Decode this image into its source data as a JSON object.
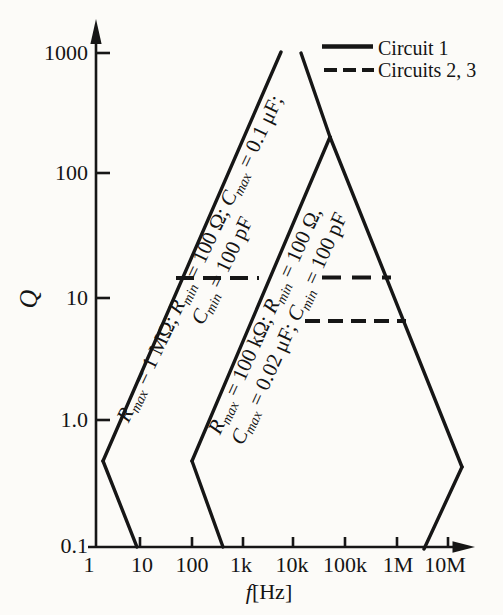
{
  "colors": {
    "ink": "#161616",
    "background": "#fcfbf8"
  },
  "axes": {
    "y_label": "Q",
    "x_label_rich": [
      {
        "t": "f",
        "i": 1
      },
      {
        "t": "[Hz]"
      }
    ],
    "y_ticks": [
      "1000",
      "100",
      "10",
      "1.0",
      "0.1"
    ],
    "x_ticks": [
      "1",
      "10",
      "100",
      "1k",
      "10k",
      "100k",
      "1M",
      "10M"
    ]
  },
  "legend": {
    "items": [
      {
        "label": "Circuit 1",
        "style": "solid"
      },
      {
        "label": "Circuits 2, 3",
        "style": "dashed"
      }
    ]
  },
  "region_labels": {
    "circuit1_line1": [
      {
        "t": "R",
        "i": 1
      },
      {
        "t": "max",
        "s": 1
      },
      {
        "t": " = 1 MΩ; "
      },
      {
        "t": "R",
        "i": 1
      },
      {
        "t": "min",
        "s": 1
      },
      {
        "t": " = 100 Ω; "
      },
      {
        "t": "C",
        "i": 1
      },
      {
        "t": "max",
        "s": 1
      },
      {
        "t": " = 0.1 μF;"
      }
    ],
    "circuit1_line2": [
      {
        "t": "C",
        "i": 1
      },
      {
        "t": "min",
        "s": 1
      },
      {
        "t": " = 100 pF"
      }
    ],
    "circuits23_line1": [
      {
        "t": "R",
        "i": 1
      },
      {
        "t": "max",
        "s": 1
      },
      {
        "t": " = 100 kΩ; "
      },
      {
        "t": "R",
        "i": 1
      },
      {
        "t": "min",
        "s": 1
      },
      {
        "t": " = 100 Ω,"
      }
    ],
    "circuits23_line2": [
      {
        "t": "C",
        "i": 1
      },
      {
        "t": "max",
        "s": 1
      },
      {
        "t": " = 0.02 μF; "
      },
      {
        "t": "C",
        "i": 1
      },
      {
        "t": "min",
        "s": 1
      },
      {
        "t": " = 100 pF"
      }
    ]
  },
  "chart_data": {
    "type": "area",
    "title": "",
    "xlabel": "f[Hz]",
    "ylabel": "Q",
    "x_scale": "log",
    "y_scale": "log",
    "xlim": [
      1,
      20000000
    ],
    "ylim": [
      0.1,
      1000
    ],
    "grid": false,
    "legend_position": "top-right",
    "x_tick_values": [
      1,
      10,
      100,
      1000,
      10000,
      100000,
      1000000,
      10000000
    ],
    "y_tick_values": [
      0.1,
      1.0,
      10,
      100,
      1000
    ],
    "series": [
      {
        "name": "Circuit 1",
        "style": "solid",
        "params": "Rmax = 1 MΩ; Rmin = 100 Ω; Cmax = 0.1 μF; Cmin = 100 pF",
        "region_outline_f_Q": [
          [
            10,
            0.1
          ],
          [
            1.8,
            0.5
          ],
          [
            9000,
            1400
          ],
          [
            50000,
            200
          ],
          [
            20000000,
            0.45
          ],
          [
            3300000,
            0.1
          ]
        ],
        "apex_truncated_at_Q": 1000
      },
      {
        "name": "Circuits 2, 3",
        "style": "dashed",
        "params": "Rmax = 100 kΩ; Rmin = 100 Ω, Cmax = 0.02 μF; Cmin = 100 pF",
        "region_outline_f_Q": [
          [
            400,
            0.1
          ],
          [
            100,
            0.5
          ],
          [
            50000,
            200
          ],
          [
            20000000,
            0.45
          ],
          [
            3300000,
            0.1
          ]
        ]
      }
    ],
    "dashed_q_lines": [
      {
        "Q": 15,
        "f_from": 60,
        "f_to": 740000
      },
      {
        "Q": 7,
        "f_from": 16000,
        "f_to": 1400000
      }
    ]
  }
}
